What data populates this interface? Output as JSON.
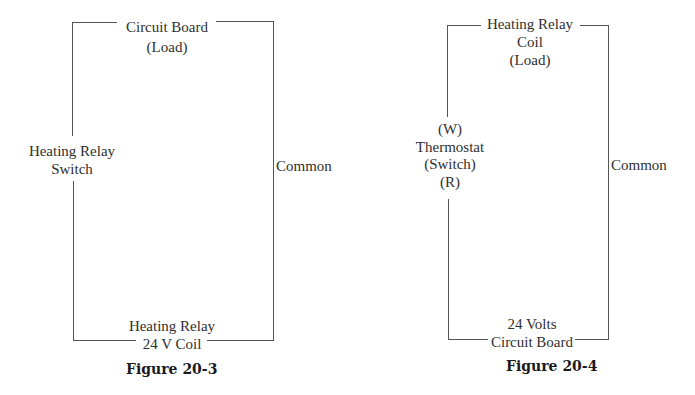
{
  "figures": [
    {
      "caption": "Figure 20-3",
      "labels": {
        "top_line1": "Circuit Board",
        "top_line2": "(Load)",
        "left_line1": "Heating Relay",
        "left_line2": "Switch",
        "right": "Common",
        "bottom_line1": "Heating Relay",
        "bottom_line2": "24 V Coil"
      }
    },
    {
      "caption": "Figure 20-4",
      "labels": {
        "top_line1": "Heating Relay",
        "top_line2": "Coil",
        "top_line3": "(Load)",
        "left_line1": "(W)",
        "left_line2": "Thermostat",
        "left_line3": "(Switch)",
        "left_line4": "(R)",
        "right": "Common",
        "bottom_line1": "24 Volts",
        "bottom_line2": "Circuit Board"
      }
    }
  ],
  "colors": {
    "wire": "#555555",
    "text": "#2f2f2f",
    "background": "#ffffff"
  }
}
